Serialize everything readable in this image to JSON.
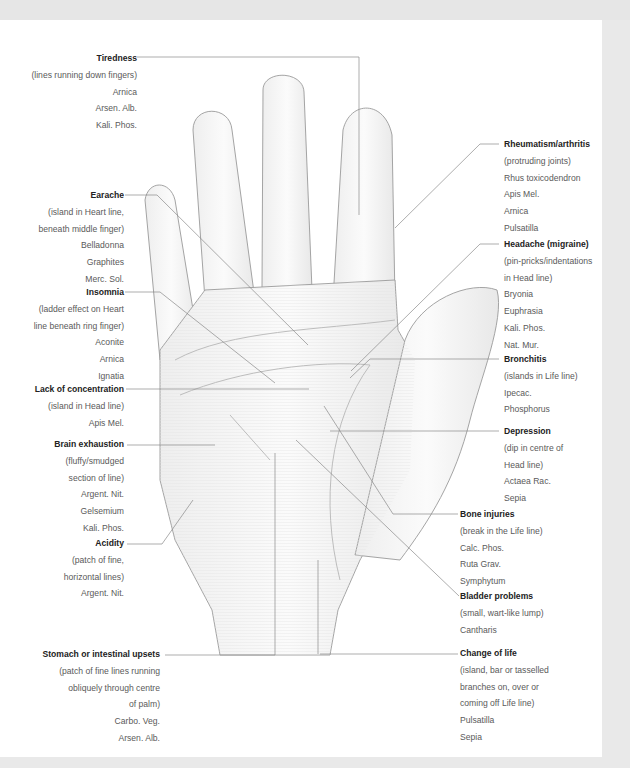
{
  "diagram": {
    "colors": {
      "page": "#ffffff",
      "frame": "#e9e9e9",
      "title_text": "#222222",
      "body_text": "#5a5a5a",
      "leader_line": "#8a8a8a"
    }
  },
  "labels_left": [
    {
      "title": "Tiredness",
      "lines": [
        "(lines running down fingers)",
        "Arnica",
        "Arsen. Alb.",
        "Kali. Phos."
      ]
    },
    {
      "title": "Earache",
      "lines": [
        "(island in Heart line,",
        "beneath middle finger)",
        "Belladonna",
        "Graphites",
        "Merc. Sol."
      ]
    },
    {
      "title": "Insomnia",
      "lines": [
        "(ladder effect on Heart",
        "line beneath ring finger)",
        "Aconite",
        "Arnica",
        "Ignatia"
      ]
    },
    {
      "title": "Lack of concentration",
      "lines": [
        "(island in Head line)",
        "Apis Mel."
      ]
    },
    {
      "title": "Brain exhaustion",
      "lines": [
        "(fluffy/smudged",
        "section of line)",
        "Argent. Nit.",
        "Gelsemium",
        "Kali. Phos."
      ]
    },
    {
      "title": "Acidity",
      "lines": [
        "(patch of fine,",
        "horizontal lines)",
        "Argent. Nit."
      ]
    },
    {
      "title": "Stomach or intestinal upsets",
      "lines": [
        "(patch of fine lines running",
        "obliquely through centre",
        "of palm)",
        "Carbo. Veg.",
        "Arsen. Alb."
      ]
    }
  ],
  "labels_right": [
    {
      "title": "Rheumatism/arthritis",
      "lines": [
        "(protruding joints)",
        "Rhus toxicodendron",
        "Apis Mel.",
        "Arnica",
        "Pulsatilla"
      ]
    },
    {
      "title": "Headache (migraine)",
      "lines": [
        "(pin-pricks/indentations",
        "in Head line)",
        "Bryonia",
        "Euphrasia",
        "Kali. Phos.",
        "Nat. Mur."
      ]
    },
    {
      "title": "Bronchitis",
      "lines": [
        "(islands in Life line)",
        "Ipecac.",
        "Phosphorus"
      ]
    },
    {
      "title": "Depression",
      "lines": [
        "(dip in centre of",
        "Head line)",
        "Actaea Rac.",
        "Sepia"
      ]
    },
    {
      "title": "Bone injuries",
      "lines": [
        "(break in the Life line)",
        "Calc. Phos.",
        "Ruta Grav.",
        "Symphytum"
      ]
    },
    {
      "title": "Bladder problems",
      "lines": [
        "(small, wart-like lump)",
        "Cantharis"
      ]
    },
    {
      "title": "Change of life",
      "lines": [
        "(island, bar or tasselled",
        "branches on, over or",
        "coming off Life line)",
        "Pulsatilla",
        "Sepia"
      ]
    }
  ]
}
